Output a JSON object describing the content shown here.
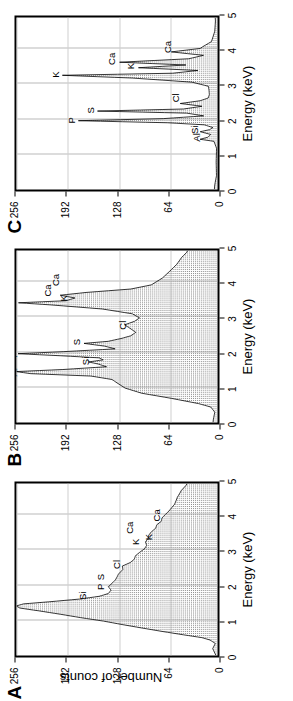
{
  "figure": {
    "axis_title_x": "Energy  (keV)",
    "axis_title_y": "Number of counts",
    "x_ticks": [
      "0",
      "1",
      "2",
      "3",
      "4",
      "5"
    ],
    "y_ticks": [
      "0",
      "64",
      "128",
      "192",
      "256"
    ],
    "panels": [
      {
        "letter": "A",
        "show_y_axis_title": true,
        "peak_labels": [
          {
            "text": "Al",
            "x": 1.45,
            "y": 250
          },
          {
            "text": "Si",
            "x": 1.72,
            "y": 162
          },
          {
            "text": "P",
            "x": 2.0,
            "y": 140
          },
          {
            "text": "S",
            "x": 2.28,
            "y": 140
          },
          {
            "text": "Cl",
            "x": 2.6,
            "y": 120
          },
          {
            "text": "K",
            "x": 3.28,
            "y": 96
          },
          {
            "text": "Ca",
            "x": 3.6,
            "y": 104
          },
          {
            "text": "K",
            "x": 3.42,
            "y": 80
          },
          {
            "text": "Ca",
            "x": 3.95,
            "y": 70
          }
        ]
      },
      {
        "letter": "B",
        "show_y_axis_title": false,
        "peak_labels": [
          {
            "text": "Al",
            "x": 1.45,
            "y": 248
          },
          {
            "text": "Si",
            "x": 1.77,
            "y": 158
          },
          {
            "text": "P",
            "x": 1.98,
            "y": 248
          },
          {
            "text": "S",
            "x": 2.34,
            "y": 170
          },
          {
            "text": "Cl",
            "x": 2.78,
            "y": 112
          },
          {
            "text": "K",
            "x": 3.48,
            "y": 252
          },
          {
            "text": "Ca",
            "x": 3.72,
            "y": 206
          },
          {
            "text": "K",
            "x": 3.58,
            "y": 186
          },
          {
            "text": "Ca",
            "x": 4.02,
            "y": 196
          }
        ]
      },
      {
        "letter": "C",
        "show_y_axis_title": false,
        "peak_labels": [
          {
            "text": "Al",
            "x": 1.5,
            "y": 20
          },
          {
            "text": "Si",
            "x": 1.72,
            "y": 22
          },
          {
            "text": "P",
            "x": 2.02,
            "y": 176
          },
          {
            "text": "S",
            "x": 2.3,
            "y": 152
          },
          {
            "text": "Cl",
            "x": 2.62,
            "y": 46
          },
          {
            "text": "K",
            "x": 3.32,
            "y": 196
          },
          {
            "text": "Ca",
            "x": 3.68,
            "y": 126
          },
          {
            "text": "K",
            "x": 3.56,
            "y": 102
          },
          {
            "text": "Ca",
            "x": 4.02,
            "y": 56
          }
        ]
      }
    ]
  },
  "chart_data": {
    "type": "line",
    "title": "",
    "xlabel": "Energy  (keV)",
    "ylabel": "Number of counts",
    "xlim": [
      0,
      5
    ],
    "ylim": [
      0,
      256
    ],
    "xticks": [
      0,
      1,
      2,
      3,
      4,
      5
    ],
    "yticks": [
      0,
      64,
      128,
      192,
      256
    ],
    "grid": true,
    "legend": "none",
    "panels": [
      {
        "label": "A",
        "annotations": [
          "Al",
          "Si",
          "P",
          "S",
          "Cl",
          "K",
          "Ca",
          "K",
          "Ca"
        ],
        "x": [
          0.0,
          0.2,
          0.35,
          0.45,
          0.52,
          0.6,
          0.7,
          0.8,
          0.9,
          1.0,
          1.1,
          1.2,
          1.3,
          1.38,
          1.44,
          1.5,
          1.56,
          1.64,
          1.72,
          1.8,
          1.9,
          2.0,
          2.1,
          2.2,
          2.3,
          2.4,
          2.5,
          2.6,
          2.7,
          2.8,
          2.9,
          3.0,
          3.1,
          3.2,
          3.3,
          3.4,
          3.5,
          3.6,
          3.7,
          3.8,
          3.9,
          4.0,
          4.2,
          4.4,
          4.6,
          4.8,
          5.0
        ],
        "y": [
          2,
          3,
          5,
          10,
          22,
          45,
          72,
          100,
          124,
          146,
          172,
          198,
          228,
          248,
          256,
          248,
          214,
          178,
          152,
          142,
          136,
          140,
          134,
          130,
          128,
          124,
          120,
          124,
          114,
          108,
          104,
          100,
          96,
          92,
          94,
          88,
          84,
          80,
          78,
          76,
          72,
          70,
          64,
          58,
          52,
          46,
          40
        ]
      },
      {
        "label": "B",
        "annotations": [
          "Al",
          "Si",
          "P",
          "S",
          "Cl",
          "K",
          "Ca",
          "K",
          "Ca"
        ],
        "x": [
          0.0,
          0.3,
          0.45,
          0.55,
          0.7,
          0.85,
          1.0,
          1.15,
          1.25,
          1.35,
          1.42,
          1.48,
          1.54,
          1.62,
          1.7,
          1.76,
          1.82,
          1.88,
          1.94,
          2.0,
          2.06,
          2.14,
          2.22,
          2.3,
          2.36,
          2.44,
          2.52,
          2.62,
          2.74,
          2.84,
          2.94,
          3.04,
          3.16,
          3.3,
          3.42,
          3.48,
          3.54,
          3.62,
          3.7,
          3.78,
          3.88,
          4.0,
          4.2,
          4.4,
          4.6,
          4.8,
          5.0
        ],
        "y": [
          2,
          4,
          10,
          26,
          58,
          96,
          122,
          132,
          136,
          160,
          240,
          256,
          196,
          140,
          150,
          166,
          146,
          150,
          200,
          256,
          196,
          134,
          146,
          170,
          138,
          120,
          110,
          104,
          112,
          118,
          108,
          100,
          112,
          150,
          214,
          256,
          190,
          178,
          200,
          168,
          110,
          88,
          72,
          64,
          56,
          48,
          40
        ]
      },
      {
        "label": "C",
        "annotations": [
          "Al",
          "Si",
          "P",
          "S",
          "Cl",
          "K",
          "Ca",
          "K",
          "Ca"
        ],
        "x": [
          0.0,
          0.4,
          0.8,
          1.2,
          1.4,
          1.46,
          1.52,
          1.6,
          1.68,
          1.74,
          1.8,
          1.88,
          1.94,
          2.0,
          2.06,
          2.14,
          2.22,
          2.28,
          2.34,
          2.42,
          2.5,
          2.58,
          2.66,
          2.76,
          2.88,
          3.0,
          3.12,
          3.24,
          3.32,
          3.38,
          3.46,
          3.54,
          3.62,
          3.7,
          3.8,
          3.9,
          4.0,
          4.1,
          4.3,
          4.6,
          5.0
        ],
        "y": [
          1,
          2,
          3,
          4,
          8,
          22,
          14,
          10,
          24,
          12,
          8,
          14,
          60,
          178,
          70,
          20,
          40,
          154,
          46,
          22,
          48,
          24,
          14,
          12,
          10,
          8,
          30,
          110,
          196,
          60,
          26,
          104,
          40,
          128,
          36,
          20,
          58,
          18,
          8,
          4,
          2
        ]
      }
    ]
  }
}
